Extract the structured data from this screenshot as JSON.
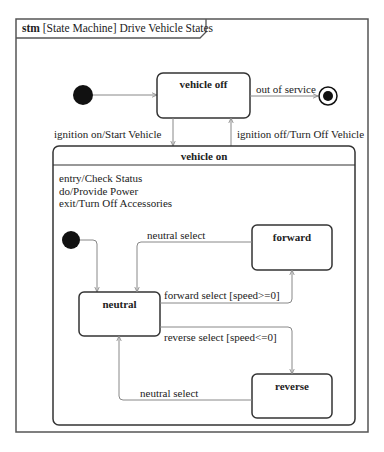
{
  "frame": {
    "keyword": "stm",
    "title": "[State Machine] Drive Vehicle States"
  },
  "states": {
    "vehicle_off": {
      "name": "vehicle off"
    },
    "vehicle_on": {
      "name": "vehicle on",
      "behaviors": [
        "entry/Check Status",
        "do/Provide Power",
        "exit/Turn Off Accessories"
      ]
    },
    "neutral": {
      "name": "neutral"
    },
    "forward": {
      "name": "forward"
    },
    "reverse": {
      "name": "reverse"
    }
  },
  "transitions": {
    "out_of_service": "out of service",
    "ignition_on": "ignition on/Start Vehicle",
    "ignition_off": "ignition off/Turn Off Vehicle",
    "forward_to_neutral": "neutral select",
    "neutral_to_forward": "forward select [speed>=0]",
    "neutral_to_reverse": "reverse select [speed<=0]",
    "reverse_to_neutral": "neutral select"
  },
  "colors": {
    "line": "#333333",
    "arrow": "#888888",
    "fill": "#ffffff"
  }
}
